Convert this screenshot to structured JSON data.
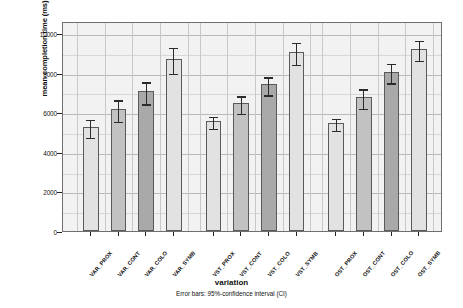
{
  "chart_data": {
    "type": "bar",
    "title": "",
    "xlabel": "variation",
    "ylabel": "mean completion time (ms)",
    "caption": "Error bars: 95%-confidence interval (CI)",
    "ylim": [
      0,
      10600
    ],
    "yticks": [
      0,
      2000,
      4000,
      6000,
      8000,
      10000
    ],
    "ytick_labels": [
      "0",
      "2000",
      "4000",
      "6000",
      "8000",
      "10000"
    ],
    "grid": true,
    "legend": "none",
    "categories": [
      "VAR_PROX",
      "VAR_CONT",
      "VAR_COLO",
      "VAR_SYMB",
      "VST_PROX",
      "VST_CONT",
      "VST_COLO",
      "VST_SYMB",
      "OST_PROX",
      "OST_CONT",
      "OST_COLO",
      "OST_SYMB"
    ],
    "values": [
      5250,
      6150,
      7050,
      8700,
      5550,
      6450,
      7400,
      9050,
      5450,
      6750,
      8050,
      9200
    ],
    "ci_lower": [
      4800,
      5600,
      6500,
      8050,
      5250,
      6000,
      6950,
      8500,
      5150,
      6250,
      7550,
      8700
    ],
    "ci_upper": [
      5700,
      6700,
      7600,
      9350,
      5850,
      6900,
      7850,
      9600,
      5750,
      7250,
      8550,
      9700
    ],
    "shades": [
      "light",
      "mid",
      "dark",
      "light",
      "light",
      "mid",
      "dark",
      "light",
      "light",
      "mid",
      "dark",
      "light"
    ],
    "group_gaps_after": [
      3,
      7
    ]
  },
  "colors": {
    "plot_background": "#f2f2f2",
    "grid": "#c8c8c8",
    "frame": "#6f6f6f",
    "bar_light": "#e2e2e2",
    "bar_mid": "#c2c2c2",
    "bar_dark": "#a9a9a9",
    "error_bar": "#2b2b2b",
    "text": "#111111"
  }
}
